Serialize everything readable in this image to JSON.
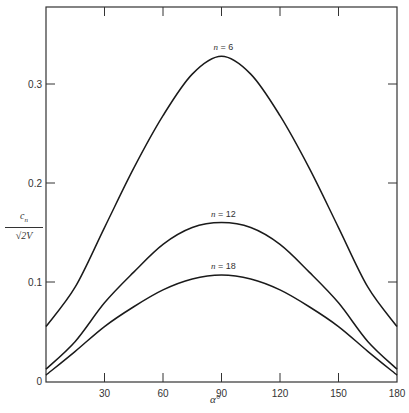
{
  "chart_data": {
    "type": "line",
    "title": "",
    "xlabel": "α°",
    "ylabel": "c_n / √2V",
    "xlim": [
      0,
      180
    ],
    "ylim": [
      0,
      0.35
    ],
    "x_ticks": [
      30,
      60,
      90,
      120,
      150,
      180
    ],
    "y_ticks": [
      0,
      0.1,
      0.2,
      0.3
    ],
    "grid": false,
    "legend": "inline labels above curve peaks",
    "x": [
      0,
      15,
      30,
      45,
      60,
      75,
      90,
      105,
      120,
      135,
      150,
      165,
      180
    ],
    "series": [
      {
        "name": "n = 6",
        "values": [
          0.055,
          0.095,
          0.155,
          0.215,
          0.268,
          0.31,
          0.328,
          0.31,
          0.268,
          0.215,
          0.155,
          0.095,
          0.055
        ]
      },
      {
        "name": "n = 12",
        "values": [
          0.012,
          0.04,
          0.079,
          0.11,
          0.138,
          0.155,
          0.16,
          0.155,
          0.138,
          0.11,
          0.079,
          0.04,
          0.012
        ]
      },
      {
        "name": "n = 18",
        "values": [
          0.006,
          0.03,
          0.055,
          0.075,
          0.092,
          0.103,
          0.107,
          0.103,
          0.092,
          0.075,
          0.055,
          0.03,
          0.006
        ]
      }
    ]
  },
  "labels": {
    "y_numerator": "c_n",
    "y_denominator": "√2V",
    "x_axis": "α°",
    "y_ticks": [
      "0",
      "0.1",
      "0.2",
      "0.3"
    ],
    "x_ticks": [
      "30",
      "60",
      "90",
      "120",
      "150",
      "180"
    ],
    "curve_labels": [
      "n = 6",
      "n = 12",
      "n = 18"
    ]
  }
}
